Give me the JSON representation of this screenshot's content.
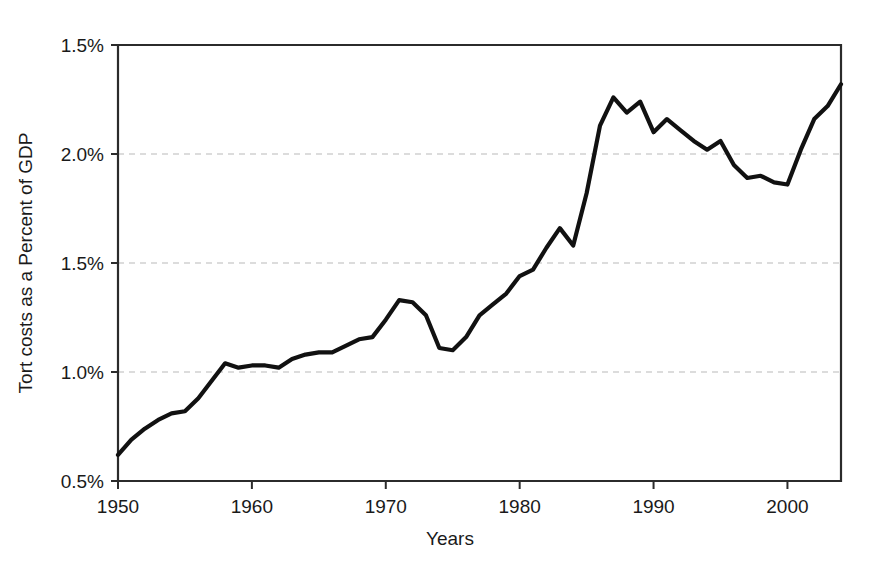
{
  "chart_data": {
    "type": "line",
    "title": "",
    "xlabel": "Years",
    "ylabel": "Tort costs as a Percent of GDP",
    "xlim": [
      1950,
      2004
    ],
    "ylim": [
      0.5,
      2.5
    ],
    "grid": true,
    "legend": null,
    "x_tick_labels": [
      "1950",
      "1960",
      "1970",
      "1980",
      "1990",
      "2000"
    ],
    "x_tick_values": [
      1950,
      1960,
      1970,
      1980,
      1990,
      2000
    ],
    "y_tick_labels": [
      "0.5%",
      "1.0%",
      "1.5%",
      "2.0%",
      "1.5%"
    ],
    "y_tick_values": [
      0.5,
      1.0,
      1.5,
      2.0,
      2.5
    ],
    "y_axis_note": "Top tick is printed as 1.5% in the scanned original; values ascend 0.5%, 1.0%, 1.5%, 2.0%, then 1.5%.",
    "x": [
      1950,
      1951,
      1952,
      1953,
      1954,
      1955,
      1956,
      1957,
      1958,
      1959,
      1960,
      1961,
      1962,
      1963,
      1964,
      1965,
      1966,
      1967,
      1968,
      1969,
      1970,
      1971,
      1972,
      1973,
      1974,
      1975,
      1976,
      1977,
      1978,
      1979,
      1980,
      1981,
      1982,
      1983,
      1984,
      1985,
      1986,
      1987,
      1988,
      1989,
      1990,
      1991,
      1992,
      1993,
      1994,
      1995,
      1996,
      1997,
      1998,
      1999,
      2000,
      2001,
      2002,
      2003,
      2004
    ],
    "values": [
      0.62,
      0.69,
      0.74,
      0.78,
      0.81,
      0.82,
      0.88,
      0.96,
      1.04,
      1.02,
      1.03,
      1.03,
      1.02,
      1.06,
      1.08,
      1.09,
      1.09,
      1.12,
      1.15,
      1.16,
      1.24,
      1.33,
      1.32,
      1.26,
      1.11,
      1.1,
      1.16,
      1.26,
      1.31,
      1.36,
      1.44,
      1.47,
      1.57,
      1.66,
      1.58,
      1.82,
      2.13,
      2.26,
      2.19,
      2.24,
      2.1,
      2.16,
      2.11,
      2.06,
      2.02,
      2.06,
      1.95,
      1.89,
      1.9,
      1.87,
      1.86,
      2.02,
      2.16,
      2.22,
      2.32
    ],
    "series_name": "Tort costs as a Percent of GDP"
  },
  "geometry": {
    "plot_left": 118,
    "plot_right": 841,
    "plot_top": 45,
    "plot_bottom": 481
  }
}
